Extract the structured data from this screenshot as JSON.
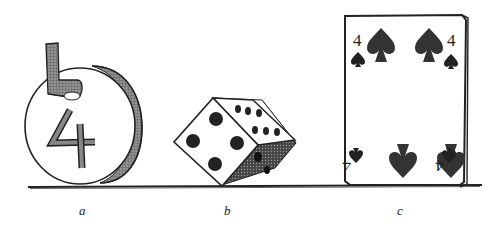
{
  "figure": {
    "panels": [
      {
        "id": "a",
        "label": "a",
        "subject": "coin-tag",
        "digit": "4"
      },
      {
        "id": "b",
        "label": "b",
        "subject": "die",
        "front_face_pips": 4,
        "top_face_pips": 6
      },
      {
        "id": "c",
        "label": "c",
        "subject": "playing-card",
        "rank": "4",
        "suit": "spades"
      }
    ],
    "colors": {
      "ink": "#1a1a1a",
      "shade": "#555555",
      "paper": "#ffffff"
    }
  }
}
